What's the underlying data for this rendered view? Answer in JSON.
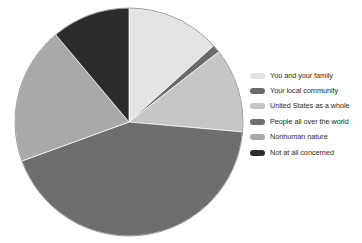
{
  "chart_data": {
    "type": "pie",
    "title": "",
    "subtitle": "",
    "xlabel": "",
    "ylabel": "",
    "grid": false,
    "legend_position": "right",
    "start_angle_deg": 0,
    "direction": "clockwise",
    "center": {
      "x": 129,
      "y": 122
    },
    "radius": 114,
    "categories": [
      "You and your family",
      "Your local community",
      "United States as a whole",
      "People all over the world",
      "Nonhuman nature",
      "Not at all concerned"
    ],
    "values": [
      13.3,
      1.1,
      12.0,
      43.1,
      19.4,
      11.1
    ],
    "colors": [
      "#e3e3e3",
      "#6a6a6a",
      "#c6c6c6",
      "#6e6e6e",
      "#a9a9a9",
      "#2b2b2b"
    ],
    "slices": [
      {
        "label": "You and your family",
        "value": 13.3,
        "start_deg": 0.0,
        "end_deg": 48.0,
        "color": "#e3e3e3"
      },
      {
        "label": "Your local community",
        "value": 1.1,
        "start_deg": 48.0,
        "end_deg": 52.0,
        "color": "#6a6a6a"
      },
      {
        "label": "United States as a whole",
        "value": 12.0,
        "start_deg": 52.0,
        "end_deg": 95.0,
        "color": "#c6c6c6"
      },
      {
        "label": "People all over the world",
        "value": 43.1,
        "start_deg": 95.0,
        "end_deg": 250.0,
        "color": "#6e6e6e"
      },
      {
        "label": "Nonhuman nature",
        "value": 19.4,
        "start_deg": 250.0,
        "end_deg": 320.0,
        "color": "#a9a9a9"
      },
      {
        "label": "Not at all concerned",
        "value": 11.1,
        "start_deg": 320.0,
        "end_deg": 360.0,
        "color": "#2b2b2b"
      }
    ],
    "annotations": []
  },
  "legend": {
    "items": [
      {
        "label": "You and your family",
        "color": "#e3e3e3"
      },
      {
        "label": "Your local community",
        "color": "#6a6a6a"
      },
      {
        "label": "United States as a whole",
        "color": "#c6c6c6"
      },
      {
        "label": "People all over the world",
        "color": "#6e6e6e"
      },
      {
        "label": "Nonhuman nature",
        "color": "#a9a9a9"
      },
      {
        "label": "Not at all concerned",
        "color": "#2b2b2b"
      }
    ]
  }
}
